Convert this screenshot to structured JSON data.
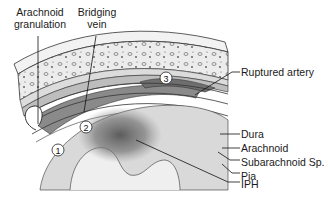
{
  "labels": {
    "arachnoid_granulation": [
      "Arachnoid",
      "granulation"
    ],
    "bridging_vein": [
      "Bridging",
      "vein"
    ],
    "ruptured_artery": "Ruptured artery",
    "dura": "Dura",
    "arachnoid": "Arachnoid",
    "subarachnoid_space": "Subarachnoid Sp.",
    "pia": "Pia",
    "iph": "IPH"
  },
  "markers": [
    "1",
    "2",
    "3"
  ],
  "colors": {
    "bone": "#e9e9e9",
    "bone_outline": "#3a3a3a",
    "hemorrhage": "#7a7a7a",
    "hemorrhage_dark": "#555555",
    "brain": "#d8d8d8",
    "leader": "#111111"
  }
}
